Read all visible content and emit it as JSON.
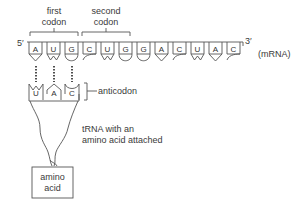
{
  "diagram": {
    "codon_labels": [
      {
        "line1": "first",
        "line2": "codon"
      },
      {
        "line1": "second",
        "line2": "codon"
      }
    ],
    "five_prime": "5′",
    "three_prime": "3′",
    "strand_label": "(mRNA)",
    "mrna_bases": [
      "A",
      "U",
      "G",
      "C",
      "U",
      "G",
      "G",
      "A",
      "C",
      "U",
      "A",
      "C"
    ],
    "anticodon_bases": [
      "U",
      "A",
      "C"
    ],
    "anticodon_label": "anticodon",
    "trna_label_line1": "tRNA with an",
    "trna_label_line2": "amino acid attached",
    "amino_acid_line1": "amino",
    "amino_acid_line2": "acid",
    "colors": {
      "line": "#555555",
      "text": "#3a3a3a",
      "background": "#ffffff"
    }
  }
}
